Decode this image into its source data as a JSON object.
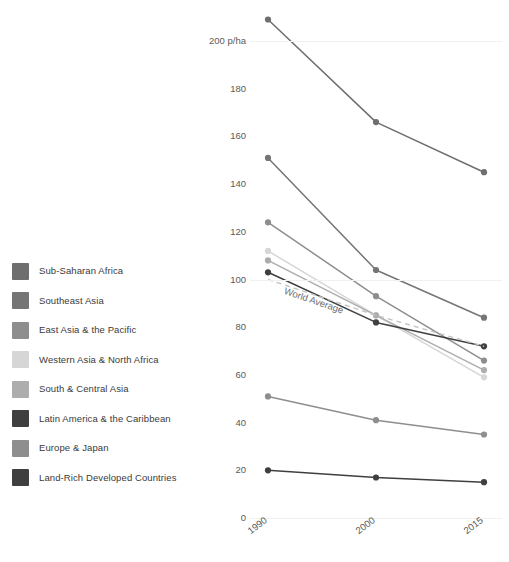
{
  "legend": {
    "items": [
      {
        "label": "Sub-Saharan Africa",
        "color": "#6e6e6e"
      },
      {
        "label": "Southeast Asia",
        "color": "#757575"
      },
      {
        "label": "East Asia & the Pacific",
        "color": "#8e8e8e"
      },
      {
        "label": "Western Asia & North Africa",
        "color": "#d6d6d6"
      },
      {
        "label": "South & Central Asia",
        "color": "#adadad"
      },
      {
        "label": "Latin America & the Caribbean",
        "color": "#3f3f3f"
      },
      {
        "label": "Europe & Japan",
        "color": "#8e8e8e"
      },
      {
        "label": "Land-Rich Developed Countries",
        "color": "#3f3f3f"
      }
    ]
  },
  "annotations": {
    "world_average_label": "World Average"
  },
  "chart_data": {
    "type": "line",
    "title": "",
    "xlabel": "",
    "ylabel": "p/ha",
    "x": [
      "1990",
      "2000",
      "2015"
    ],
    "categories": [
      "1990",
      "2000",
      "2015"
    ],
    "ylim": [
      0,
      200
    ],
    "yticks": [
      0,
      20,
      40,
      60,
      80,
      100,
      120,
      140,
      160,
      180,
      200
    ],
    "ytick_labels": [
      "0",
      "20",
      "40",
      "60",
      "80",
      "100",
      "120",
      "140",
      "160",
      "180",
      "200 p/ha"
    ],
    "grid": true,
    "legend_position": "left",
    "series": [
      {
        "name": "Sub-Saharan Africa",
        "values": [
          209,
          166,
          145
        ],
        "color": "#6e6e6e",
        "style": "solid"
      },
      {
        "name": "Southeast Asia",
        "values": [
          151,
          104,
          84
        ],
        "color": "#757575",
        "style": "solid"
      },
      {
        "name": "East Asia & the Pacific",
        "values": [
          124,
          93,
          66
        ],
        "color": "#8e8e8e",
        "style": "solid"
      },
      {
        "name": "Western Asia & North Africa",
        "values": [
          112,
          85,
          59
        ],
        "color": "#d6d6d6",
        "style": "solid"
      },
      {
        "name": "South & Central Asia",
        "values": [
          108,
          85,
          62
        ],
        "color": "#adadad",
        "style": "solid"
      },
      {
        "name": "Latin America & the Caribbean",
        "values": [
          103,
          82,
          72
        ],
        "color": "#3f3f3f",
        "style": "solid"
      },
      {
        "name": "Europe & Japan",
        "values": [
          51,
          41,
          35
        ],
        "color": "#8e8e8e",
        "style": "solid"
      },
      {
        "name": "Land-Rich Developed Countries",
        "values": [
          20,
          17,
          15
        ],
        "color": "#3f3f3f",
        "style": "solid"
      },
      {
        "name": "World Average",
        "values": [
          100,
          85,
          72
        ],
        "color": "#c4c4c4",
        "style": "dashed"
      }
    ]
  }
}
